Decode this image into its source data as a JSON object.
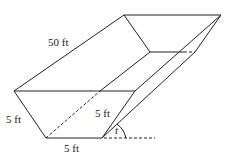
{
  "diagram": {
    "type": "trough-3d-figure",
    "labels": {
      "length": "50 ft",
      "side_left": "5 ft",
      "side_right": "5 ft",
      "bottom": "5 ft",
      "angle": "t"
    },
    "colors": {
      "stroke": "#222222",
      "background": "#ffffff"
    }
  }
}
